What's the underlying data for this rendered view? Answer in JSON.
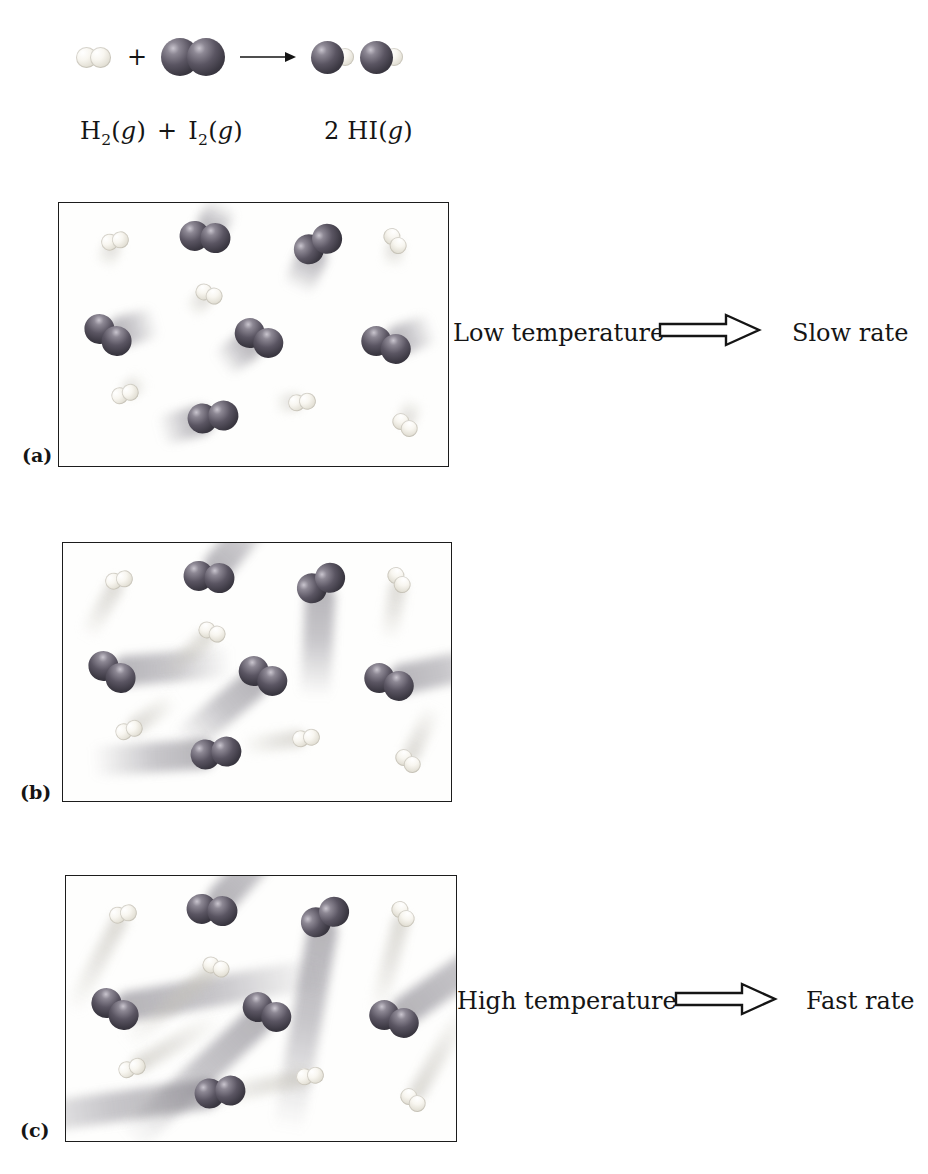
{
  "equation": {
    "plus": "+",
    "h2": {
      "base": "H",
      "sub": "2"
    },
    "i2": {
      "base": "I",
      "sub": "2"
    },
    "product": {
      "coeff": "2",
      "base": "HI"
    },
    "state_open": "(",
    "state_g": "g",
    "state_close": ")"
  },
  "annotations": {
    "a": {
      "left_label": "Low temperature",
      "right_label": "Slow rate"
    },
    "c": {
      "left_label": "High temperature",
      "right_label": "Fast rate"
    }
  },
  "colors": {
    "iodine_sphere": "#3b3842",
    "hydrogen_sphere": "#e6e3d9",
    "dark_trail": "#76737c",
    "light_trail": "#c6c3ba",
    "text": "#151515",
    "panel_border": "#1c1c1c",
    "background": "#ffffff"
  },
  "panels": [
    {
      "id": "a",
      "label": "(a)",
      "condition": "low temperature, slow molecules, short motion trails",
      "molecules": [
        {
          "type": "I2",
          "x": 37.5,
          "y": 13,
          "rot": 6,
          "trail_angle": -60,
          "trail": 42
        },
        {
          "type": "I2",
          "x": 66.5,
          "y": 15.5,
          "rot": -30,
          "trail_angle": 115,
          "trail": 55
        },
        {
          "type": "I2",
          "x": 12.5,
          "y": 50,
          "rot": 35,
          "trail_angle": -15,
          "trail": 55
        },
        {
          "type": "I2",
          "x": 51.5,
          "y": 51.5,
          "rot": 28,
          "trail_angle": 145,
          "trail": 50
        },
        {
          "type": "I2",
          "x": 84,
          "y": 54,
          "rot": 22,
          "trail_angle": -20,
          "trail": 55
        },
        {
          "type": "I2",
          "x": 39.5,
          "y": 81.5,
          "rot": -8,
          "trail_angle": 165,
          "trail": 60
        },
        {
          "type": "H2",
          "x": 14.5,
          "y": 14.5,
          "rot": -12,
          "trail_angle": 115,
          "trail": 30
        },
        {
          "type": "H2",
          "x": 86.5,
          "y": 14.5,
          "rot": 55,
          "trail_angle": 95,
          "trail": 28
        },
        {
          "type": "H2",
          "x": 38.5,
          "y": 34.5,
          "rot": 22,
          "trail_angle": 135,
          "trail": 30
        },
        {
          "type": "H2",
          "x": 17,
          "y": 72.5,
          "rot": -18,
          "trail_angle": -40,
          "trail": 26
        },
        {
          "type": "H2",
          "x": 62.5,
          "y": 75.5,
          "rot": -8,
          "trail_angle": 175,
          "trail": 30
        },
        {
          "type": "H2",
          "x": 89,
          "y": 84.5,
          "rot": 40,
          "trail_angle": -70,
          "trail": 30
        }
      ]
    },
    {
      "id": "b",
      "label": "(b)",
      "condition": "medium temperature, faster molecules, medium motion trails",
      "molecules": [
        {
          "type": "I2",
          "x": 37.5,
          "y": 13,
          "rot": 6,
          "trail_angle": -50,
          "trail": 95
        },
        {
          "type": "I2",
          "x": 66.5,
          "y": 15.5,
          "rot": -30,
          "trail_angle": 93,
          "trail": 125
        },
        {
          "type": "I2",
          "x": 12.5,
          "y": 50,
          "rot": 35,
          "trail_angle": -5,
          "trail": 130
        },
        {
          "type": "I2",
          "x": 51.5,
          "y": 51.5,
          "rot": 28,
          "trail_angle": 140,
          "trail": 115
        },
        {
          "type": "I2",
          "x": 84,
          "y": 54,
          "rot": 22,
          "trail_angle": -12,
          "trail": 125
        },
        {
          "type": "I2",
          "x": 39.5,
          "y": 81.5,
          "rot": -8,
          "trail_angle": 176,
          "trail": 135
        },
        {
          "type": "H2",
          "x": 14.5,
          "y": 14.5,
          "rot": -12,
          "trail_angle": 120,
          "trail": 70
        },
        {
          "type": "H2",
          "x": 86.5,
          "y": 14.5,
          "rot": 55,
          "trail_angle": 100,
          "trail": 66
        },
        {
          "type": "H2",
          "x": 38.5,
          "y": 34.5,
          "rot": 22,
          "trail_angle": 138,
          "trail": 72
        },
        {
          "type": "H2",
          "x": 17,
          "y": 72.5,
          "rot": -18,
          "trail_angle": -35,
          "trail": 60
        },
        {
          "type": "H2",
          "x": 62.5,
          "y": 75.5,
          "rot": -8,
          "trail_angle": 172,
          "trail": 70
        },
        {
          "type": "H2",
          "x": 89,
          "y": 84.5,
          "rot": 40,
          "trail_angle": -65,
          "trail": 66
        }
      ]
    },
    {
      "id": "c",
      "label": "(c)",
      "condition": "high temperature, fast molecules, long motion trails",
      "molecules": [
        {
          "type": "I2",
          "x": 37.5,
          "y": 13,
          "rot": 6,
          "trail_angle": -48,
          "trail": 170
        },
        {
          "type": "I2",
          "x": 66.5,
          "y": 15.5,
          "rot": -30,
          "trail_angle": 100,
          "trail": 235
        },
        {
          "type": "I2",
          "x": 12.5,
          "y": 50,
          "rot": 35,
          "trail_angle": -10,
          "trail": 230
        },
        {
          "type": "I2",
          "x": 51.5,
          "y": 51.5,
          "rot": 28,
          "trail_angle": 137,
          "trail": 205
        },
        {
          "type": "I2",
          "x": 84,
          "y": 54,
          "rot": 22,
          "trail_angle": -35,
          "trail": 225
        },
        {
          "type": "I2",
          "x": 39.5,
          "y": 81.5,
          "rot": -8,
          "trail_angle": 172,
          "trail": 245
        },
        {
          "type": "H2",
          "x": 14.5,
          "y": 14.5,
          "rot": -12,
          "trail_angle": 118,
          "trail": 120
        },
        {
          "type": "H2",
          "x": 86.5,
          "y": 14.5,
          "rot": 55,
          "trail_angle": 105,
          "trail": 112
        },
        {
          "type": "H2",
          "x": 38.5,
          "y": 34.5,
          "rot": 22,
          "trail_angle": 140,
          "trail": 128
        },
        {
          "type": "H2",
          "x": 17,
          "y": 72.5,
          "rot": -18,
          "trail_angle": -30,
          "trail": 108
        },
        {
          "type": "H2",
          "x": 62.5,
          "y": 75.5,
          "rot": -8,
          "trail_angle": 168,
          "trail": 122
        },
        {
          "type": "H2",
          "x": 89,
          "y": 84.5,
          "rot": 40,
          "trail_angle": -60,
          "trail": 115
        }
      ]
    }
  ]
}
